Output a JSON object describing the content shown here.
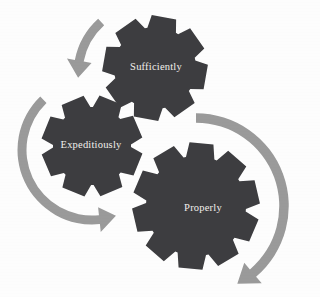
{
  "canvas": {
    "width": 320,
    "height": 297,
    "background_color": "#fdfdfd"
  },
  "palette": {
    "gear_fill": "#3d3d40",
    "gear_fill_shadow": "#36363a",
    "arrow_fill": "#9a9a9a",
    "label_color": "#f2f0ec",
    "background": "#fdfdfd"
  },
  "diagram": {
    "type": "cycle-gears",
    "gears": [
      {
        "id": "sufficiently",
        "label": "Sufficiently",
        "center_x": 155,
        "center_y": 68,
        "outer_radius": 53,
        "inner_radius": 41,
        "teeth": 8,
        "rotation_deg": 10,
        "font_size": 10.5,
        "label_x": 156,
        "label_y": 68,
        "z": 1
      },
      {
        "id": "expeditiously",
        "label": "Expeditiously",
        "center_x": 92,
        "center_y": 146,
        "outer_radius": 51,
        "inner_radius": 39,
        "teeth": 8,
        "rotation_deg": 22,
        "font_size": 10.5,
        "label_x": 91,
        "label_y": 146,
        "z": 2
      },
      {
        "id": "properly",
        "label": "Properly",
        "center_x": 196,
        "center_y": 206,
        "outer_radius": 64,
        "inner_radius": 50,
        "teeth": 10,
        "rotation_deg": 5,
        "font_size": 10.5,
        "label_x": 203,
        "label_y": 209,
        "z": 3
      }
    ],
    "arrows": [
      {
        "id": "arrow-top",
        "direction": "counter-clockwise-to-upper-right",
        "head_x": 105,
        "head_y": 16,
        "tail_x": 81,
        "tail_y": 72,
        "color": "#9a9a9a"
      },
      {
        "id": "arrow-left",
        "direction": "counter-clockwise-to-lower-left",
        "head_x": 22,
        "head_y": 154,
        "tail_x": 78,
        "tail_y": 86,
        "color": "#9a9a9a"
      },
      {
        "id": "arrow-right",
        "direction": "clockwise-to-lower-left",
        "head_x": 281,
        "head_y": 273,
        "tail_x": 196,
        "tail_y": 121,
        "color": "#9a9a9a"
      }
    ],
    "ghost_bleed_text": [
      {
        "text": "",
        "x": 0,
        "y": 0,
        "size": 9
      }
    ]
  }
}
